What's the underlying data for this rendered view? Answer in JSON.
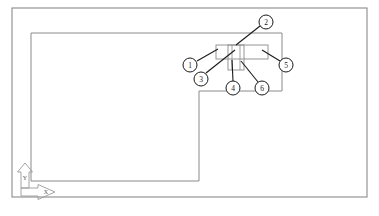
{
  "drawing": {
    "type": "cad-technical-drawing",
    "background_color": "#ffffff",
    "line_color": "#8a8a8a",
    "leader_color": "#1a1a1a",
    "balloon_fill": "#ffffff",
    "sheet_frame": {
      "label": "sheet-border",
      "x": 12,
      "y": 8,
      "width": 355,
      "height": 189
    },
    "part_outline": {
      "label": "part-outline-polyline",
      "points": "31,33 282,33 282,91 199,91 199,181 31,181 31,33"
    },
    "detail_region": {
      "label": "detail-assembly",
      "band_rect": {
        "x": 216,
        "y": 45,
        "width": 52,
        "height": 14
      },
      "sub_rect": {
        "x": 228,
        "y": 45,
        "width": 16,
        "height": 25
      },
      "inner_vline_1": {
        "x": 232,
        "y1": 45,
        "y2": 70
      },
      "inner_vline_2": {
        "x": 240,
        "y1": 45,
        "y2": 70
      }
    },
    "balloons": [
      {
        "id": "balloon-1",
        "label": "1",
        "cx": 190,
        "cy": 65,
        "r": 7,
        "leader": "197,61 218,49"
      },
      {
        "id": "balloon-2",
        "label": "2",
        "cx": 266,
        "cy": 22,
        "r": 7,
        "leader": "260,26 236,45"
      },
      {
        "id": "balloon-3",
        "label": "3",
        "cx": 201,
        "cy": 79,
        "r": 7,
        "leader": "206,73 235,50"
      },
      {
        "id": "balloon-4",
        "label": "4",
        "cx": 233,
        "cy": 88,
        "r": 7,
        "leader": "233,81 232,60"
      },
      {
        "id": "balloon-5",
        "label": "5",
        "cx": 286,
        "cy": 65,
        "r": 7,
        "leader": "280,61 262,50"
      },
      {
        "id": "balloon-6",
        "label": "6",
        "cx": 262,
        "cy": 88,
        "r": 7,
        "leader": "258,82 241,61"
      }
    ],
    "axis_indicator": {
      "label": "ucs-axis-marker",
      "y_axis": {
        "label": "Y",
        "text_x": 25,
        "text_y": 178
      },
      "x_axis": {
        "label": "X",
        "text_x": 46,
        "text_y": 192
      }
    }
  }
}
